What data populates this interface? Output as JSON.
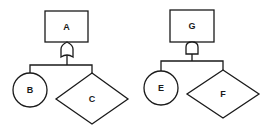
{
  "diagram": {
    "type": "fault-tree",
    "colors": {
      "stroke": "#1a1a1a",
      "background": "#ffffff"
    },
    "trees": [
      {
        "top_event": {
          "label": "A",
          "shape": "rectangle"
        },
        "gate": {
          "type": "OR"
        },
        "children": [
          {
            "label": "B",
            "shape": "circle"
          },
          {
            "label": "C",
            "shape": "diamond"
          }
        ]
      },
      {
        "top_event": {
          "label": "G",
          "shape": "rectangle"
        },
        "gate": {
          "type": "AND"
        },
        "children": [
          {
            "label": "E",
            "shape": "circle"
          },
          {
            "label": "F",
            "shape": "diamond"
          }
        ]
      }
    ]
  }
}
